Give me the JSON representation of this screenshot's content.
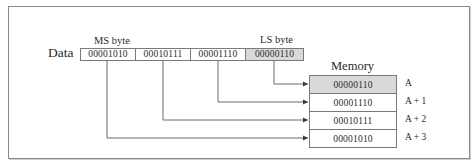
{
  "figure": {
    "caption_clipped": "gure 4.5  Little-endian byte ordering"
  },
  "labels": {
    "ms_byte": "MS byte",
    "ls_byte": "LS byte",
    "data": "Data",
    "memory": "Memory"
  },
  "data_bytes": [
    {
      "value": "00001010",
      "role": "MS byte",
      "shaded": false
    },
    {
      "value": "00010111",
      "role": "",
      "shaded": false
    },
    {
      "value": "00001110",
      "role": "",
      "shaded": false
    },
    {
      "value": "00000110",
      "role": "LS byte",
      "shaded": true
    }
  ],
  "memory": [
    {
      "value": "00000110",
      "address": "A",
      "shaded": true
    },
    {
      "value": "00001110",
      "address": "A + 1",
      "shaded": false
    },
    {
      "value": "00010111",
      "address": "A + 2",
      "shaded": false
    },
    {
      "value": "00001010",
      "address": "A + 3",
      "shaded": false
    }
  ],
  "connections": [
    {
      "from_byte": 3,
      "to_address": "A"
    },
    {
      "from_byte": 2,
      "to_address": "A + 1"
    },
    {
      "from_byte": 1,
      "to_address": "A + 2"
    },
    {
      "from_byte": 0,
      "to_address": "A + 3"
    }
  ],
  "colors": {
    "shade": "#d9d9d9",
    "line": "#7a7a7a",
    "text": "#2a2a2a"
  }
}
